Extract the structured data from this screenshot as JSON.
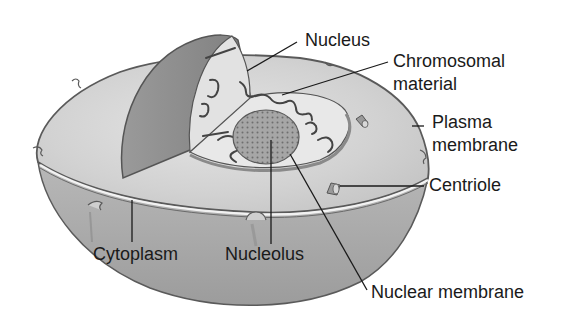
{
  "diagram": {
    "labels": {
      "nucleus": "Nucleus",
      "chromosomal_line1": "Chromosomal",
      "chromosomal_line2": "material",
      "plasma_line1": "Plasma",
      "plasma_line2": "membrane",
      "centriole": "Centriole",
      "cytoplasm": "Cytoplasm",
      "nucleolus": "Nucleolus",
      "nuclear_membrane": "Nuclear membrane"
    },
    "colors": {
      "background": "#ffffff",
      "cytoplasm_top": "#d9d9d9",
      "cytoplasm_side": "#a8a8a8",
      "nucleus_shell": "#8e8e8e",
      "nucleus_interior": "#e6e6e6",
      "nucleolus": "#9a9a9a",
      "outline": "#555555",
      "leader_line": "#1a1a1a"
    }
  }
}
